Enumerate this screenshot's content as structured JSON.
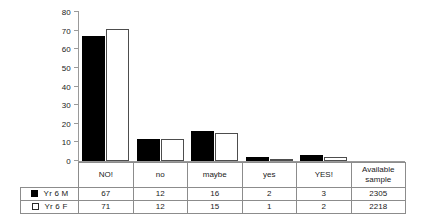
{
  "chart_data": {
    "type": "bar",
    "title": "",
    "subtitle": "",
    "xlabel": "",
    "ylabel": "",
    "ylim": [
      0,
      80
    ],
    "yticks": [
      0,
      10,
      20,
      30,
      40,
      50,
      60,
      70,
      80
    ],
    "ytick_labels": [
      "0",
      "10",
      "20",
      "30",
      "40",
      "50",
      "60",
      "70",
      "80"
    ],
    "grid": false,
    "legend_position": "table-row-labels",
    "categories": [
      "NO!",
      "no",
      "maybe",
      "yes",
      "YES!"
    ],
    "series": [
      {
        "name": "Yr 6 M",
        "values": [
          67,
          12,
          16,
          2,
          3
        ],
        "swatch": "filled",
        "available_sample": "2305"
      },
      {
        "name": "Yr 6 F",
        "values": [
          71,
          12,
          15,
          1,
          2
        ],
        "swatch": "hollow",
        "available_sample": "2218"
      }
    ],
    "extra_column_header": "Available sample",
    "extra_column_header_line1": "Available",
    "extra_column_header_line2": "sample"
  },
  "table": {
    "header": {
      "spacer": "",
      "cells": [
        "NO!",
        "no",
        "maybe",
        "yes",
        "YES!"
      ],
      "available_line1": "Available",
      "available_line2": "sample"
    },
    "rows": [
      {
        "swatch": "filled",
        "label": "Yr 6 M",
        "values": [
          "67",
          "12",
          "16",
          "2",
          "3"
        ],
        "available_sample": "2305"
      },
      {
        "swatch": "hollow",
        "label": "Yr 6 F",
        "values": [
          "71",
          "12",
          "15",
          "1",
          "2"
        ],
        "available_sample": "2218"
      }
    ]
  },
  "colors": {
    "series_m": "#000000",
    "series_f": "#ffffff",
    "series_f_border": "#4d4d4d",
    "axis": "#9a9a9a",
    "table_border": "#8c8c8c",
    "text": "#1a1a1a",
    "background": "#ffffff"
  }
}
